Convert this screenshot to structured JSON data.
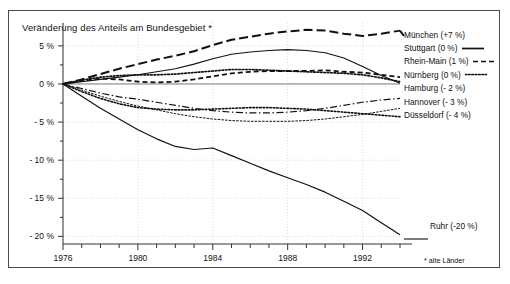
{
  "chart_data": {
    "type": "line",
    "title": "Veränderung des Anteils am Bundesgebiet *",
    "xlabel": "",
    "ylabel": "",
    "footnote": "* alte Länder",
    "grid": true,
    "legend_position": "right",
    "xlim": [
      1976,
      1994
    ],
    "ylim": [
      -21,
      8
    ],
    "yticks": [
      5,
      0,
      -5,
      -10,
      -15,
      -20
    ],
    "ytick_labels": [
      "5 %",
      "0 %",
      "- 5 %",
      "- 10 %",
      "- 15 %",
      "- 20 %"
    ],
    "xticks": [
      1976,
      1977,
      1978,
      1979,
      1980,
      1981,
      1982,
      1983,
      1984,
      1985,
      1986,
      1987,
      1988,
      1989,
      1990,
      1991,
      1992,
      1993,
      1994
    ],
    "xtick_labels_shown": [
      "1976",
      "1980",
      "1984",
      "1988",
      "1992"
    ],
    "x": [
      1976,
      1977,
      1978,
      1979,
      1980,
      1981,
      1982,
      1983,
      1984,
      1985,
      1986,
      1987,
      1988,
      1989,
      1990,
      1991,
      1992,
      1993,
      1994
    ],
    "series": [
      {
        "name": "München",
        "label": "München (+7 %)",
        "end_value_label": "+7 %",
        "style": "long-dash",
        "width": 2.0,
        "values": [
          0,
          0.6,
          1.3,
          2.0,
          2.6,
          3.2,
          3.7,
          4.3,
          5.1,
          5.8,
          6.2,
          6.6,
          6.9,
          7.1,
          7.0,
          6.6,
          6.3,
          6.6,
          7.0
        ]
      },
      {
        "name": "Stuttgart",
        "label": "Stuttgart (0 %)",
        "end_value_label": "0 %",
        "style": "solid",
        "width": 1.1,
        "values": [
          0,
          0.3,
          0.6,
          0.9,
          1.2,
          1.6,
          2.0,
          2.6,
          3.3,
          3.9,
          4.2,
          4.4,
          4.5,
          4.4,
          4.1,
          3.4,
          2.3,
          1.1,
          0.1
        ]
      },
      {
        "name": "Rhein-Main",
        "label": "Rhein-Main (1 %)",
        "end_value_label": "1 %",
        "style": "dash",
        "width": 1.8,
        "values": [
          0,
          0.4,
          0.7,
          0.6,
          0.3,
          0.2,
          0.3,
          0.6,
          1.0,
          1.4,
          1.6,
          1.7,
          1.7,
          1.7,
          1.8,
          1.6,
          1.5,
          1.2,
          0.9
        ]
      },
      {
        "name": "Nürnberg",
        "label": "Nürnberg (0 %)",
        "end_value_label": "0 %",
        "style": "dotted",
        "width": 1.7,
        "values": [
          0,
          0.5,
          0.9,
          1.1,
          1.2,
          1.2,
          1.3,
          1.5,
          1.7,
          1.9,
          1.9,
          1.8,
          1.7,
          1.6,
          1.5,
          1.4,
          1.2,
          0.8,
          0.3
        ]
      },
      {
        "name": "Hamburg",
        "label": "Hamburg (- 2 %)",
        "end_value_label": "- 2 %",
        "style": "dash-dot",
        "width": 1.2,
        "values": [
          0,
          -0.6,
          -1.2,
          -1.7,
          -2.0,
          -2.4,
          -2.8,
          -3.2,
          -3.5,
          -3.7,
          -3.8,
          -3.8,
          -3.7,
          -3.5,
          -3.2,
          -2.8,
          -2.4,
          -2.1,
          -1.9
        ]
      },
      {
        "name": "Hannover",
        "label": "Hannover (- 3 %)",
        "end_value_label": "- 3 %",
        "style": "fine-wave",
        "width": 1.0,
        "values": [
          0,
          -0.8,
          -1.6,
          -2.3,
          -2.9,
          -3.4,
          -3.9,
          -4.3,
          -4.6,
          -4.8,
          -4.9,
          -4.9,
          -4.9,
          -4.8,
          -4.6,
          -4.3,
          -4.0,
          -3.6,
          -3.2
        ]
      },
      {
        "name": "Düsseldorf",
        "label": "Düsseldorf (- 4 %)",
        "end_value_label": "- 4 %",
        "style": "dotted",
        "width": 1.6,
        "values": [
          0,
          -1.0,
          -1.9,
          -2.6,
          -3.1,
          -3.3,
          -3.4,
          -3.4,
          -3.3,
          -3.2,
          -3.1,
          -3.1,
          -3.2,
          -3.3,
          -3.5,
          -3.7,
          -3.9,
          -4.1,
          -4.3
        ]
      },
      {
        "name": "Ruhr",
        "label": "Ruhr (-20 %)",
        "end_value_label": "-20 %",
        "style": "solid",
        "width": 1.2,
        "values": [
          0,
          -1.6,
          -3.2,
          -4.6,
          -6.0,
          -7.2,
          -8.2,
          -8.6,
          -8.4,
          -9.4,
          -10.4,
          -11.4,
          -12.3,
          -13.2,
          -14.2,
          -15.4,
          -16.6,
          -18.2,
          -19.8
        ]
      }
    ]
  },
  "legend": {
    "entries": [
      {
        "label": "München (+7 %)",
        "sample": "long-dash",
        "sample_side": "left"
      },
      {
        "label": "Stuttgart (0 %)",
        "sample": "solid",
        "sample_side": "right"
      },
      {
        "label": "Rhein-Main (1 %)",
        "sample": "dash",
        "sample_side": "right"
      },
      {
        "label": "Nürnberg (0 %)",
        "sample": "dotted",
        "sample_side": "right"
      },
      {
        "label": "Hamburg (- 2 %)",
        "sample": "dash-dot",
        "sample_side": "none"
      },
      {
        "label": "Hannover (- 3 %)",
        "sample": "fine-wave",
        "sample_side": "none"
      },
      {
        "label": "Düsseldorf (- 4 %)",
        "sample": "dotted",
        "sample_side": "none"
      }
    ]
  },
  "annotations": {
    "ruhr": "Ruhr (-20 %)"
  },
  "colors": {
    "ink": "#111111",
    "frame": "#4a4a4a",
    "grid": "#cccccc",
    "background": "#ffffff"
  }
}
